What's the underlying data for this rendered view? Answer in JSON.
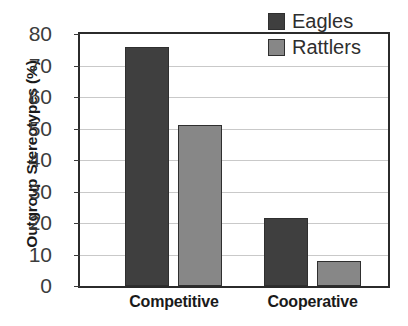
{
  "chart_data": {
    "type": "bar",
    "title": "",
    "xlabel": "",
    "ylabel": "Outgroup Stereotypes (%)",
    "categories": [
      "Competitive",
      "Cooperative"
    ],
    "series": [
      {
        "name": "Eagles",
        "color": "#3f3f3f",
        "values": [
          76,
          21.5
        ]
      },
      {
        "name": "Rattlers",
        "color": "#878787",
        "values": [
          51,
          8
        ]
      }
    ],
    "ylim": [
      0,
      80
    ],
    "ytick_step": 10,
    "yticks": [
      "80",
      "70",
      "60",
      "50",
      "40",
      "30",
      "20",
      "10",
      "0"
    ],
    "grid": true,
    "legend_position": "top-right"
  },
  "figure": {
    "background_color": "#ffffff",
    "axis_color": "#2b2b2b",
    "grid_color": "#c9c9c9"
  }
}
